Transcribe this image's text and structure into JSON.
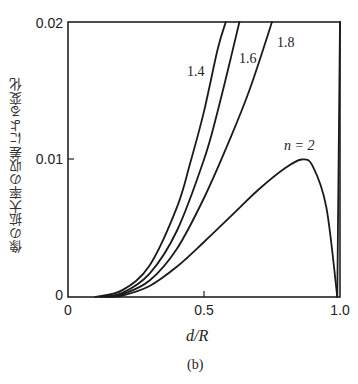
{
  "chart_data": {
    "type": "line",
    "title": "",
    "caption": "(b)",
    "xlabel": "d/R",
    "ylabel": "像の拡大率の収差による変化",
    "xlim": [
      0,
      1.0
    ],
    "ylim": [
      0,
      0.02
    ],
    "xticks": [
      "0",
      "0.5",
      "1.0"
    ],
    "yticks": [
      "0",
      "0.01",
      "0.02"
    ],
    "grid": false,
    "legend": "inline labels",
    "series": [
      {
        "name": "1.4",
        "label": "1.4",
        "x": [
          0.1,
          0.2,
          0.3,
          0.4,
          0.45,
          0.5,
          0.55,
          0.58
        ],
        "y": [
          0.0,
          0.0005,
          0.0023,
          0.0065,
          0.0098,
          0.0135,
          0.018,
          0.02
        ]
      },
      {
        "name": "1.6",
        "label": "1.6",
        "x": [
          0.12,
          0.2,
          0.3,
          0.4,
          0.5,
          0.55,
          0.6,
          0.63
        ],
        "y": [
          0.0,
          0.0003,
          0.0017,
          0.0048,
          0.01,
          0.0135,
          0.0175,
          0.02
        ]
      },
      {
        "name": "1.8",
        "label": "1.8",
        "x": [
          0.14,
          0.2,
          0.3,
          0.4,
          0.5,
          0.6,
          0.67,
          0.75
        ],
        "y": [
          0.0,
          0.0002,
          0.0012,
          0.0035,
          0.0072,
          0.0117,
          0.0152,
          0.02
        ]
      },
      {
        "name": "n=2",
        "label": "n = 2",
        "x": [
          0.15,
          0.2,
          0.3,
          0.4,
          0.5,
          0.6,
          0.7,
          0.8,
          0.86,
          0.9,
          0.95,
          0.99
        ],
        "y": [
          0.0,
          0.0001,
          0.0008,
          0.0022,
          0.004,
          0.0059,
          0.0078,
          0.0094,
          0.01,
          0.0095,
          0.0065,
          0.0
        ]
      }
    ]
  },
  "labels": {
    "xlabel": "d/R",
    "ylabel": "像の拡大率の収差による変化",
    "caption": "(b)",
    "xtick_0": "0",
    "xtick_1": "0.5",
    "xtick_2": "1.0",
    "ytick_0": "0",
    "ytick_1": "0.01",
    "ytick_2": "0.02",
    "curve_14": "1.4",
    "curve_16": "1.6",
    "curve_18": "1.8",
    "curve_n2": "n = 2"
  }
}
